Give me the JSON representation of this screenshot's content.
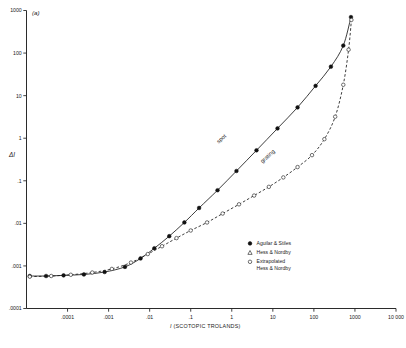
{
  "figure": {
    "panel_label": "(a)",
    "ylabel": "ΔI"
  },
  "chart_data": {
    "type": "line",
    "title": "",
    "subtitle": "",
    "xlabel": "I (SCOTOPIC TROLANDS)",
    "ylabel": "ΔI",
    "xscale": "log",
    "yscale": "log",
    "xlim": [
      1e-05,
      10000
    ],
    "ylim": [
      0.0001,
      1000
    ],
    "grid": false,
    "legend_position": "inside-lower-right",
    "xticklabels": [
      ".0001",
      ".001",
      ".01",
      ".1",
      "1",
      "10",
      "100",
      "1000",
      "10 000"
    ],
    "xtickvalues": [
      0.0001,
      0.001,
      0.01,
      0.1,
      1,
      10,
      100,
      1000,
      10000
    ],
    "yticklabels": [
      "1000",
      "100",
      "10",
      "1",
      ".1",
      ".01",
      ".001",
      ".0001"
    ],
    "ytickvalues": [
      1000,
      100,
      10,
      1,
      0.1,
      0.01,
      0.001,
      0.0001
    ],
    "annotations": [
      {
        "text": "spot",
        "x": 0.6,
        "y": 0.9,
        "rotation": -42
      },
      {
        "text": "grating",
        "x": 8,
        "y": 0.35,
        "rotation": -42
      }
    ],
    "legend": [
      {
        "label": "Aguilar & Stiles",
        "marker": "filled-circle"
      },
      {
        "label": "Hess & Nordby",
        "marker": "triangle"
      },
      {
        "label": "Extrapolated Hess & Nordby",
        "marker": "open-circle"
      }
    ],
    "series": [
      {
        "name": "spot",
        "marker": "filled-circle",
        "linestyle": "solid",
        "legend_ref": "Aguilar & Stiles",
        "x": [
          1.2e-05,
          3e-05,
          8e-05,
          0.00025,
          0.0008,
          0.0025,
          0.006,
          0.013,
          0.03,
          0.07,
          0.16,
          0.45,
          1.3,
          4.0,
          13,
          40,
          110,
          260,
          520,
          800
        ],
        "y": [
          0.00058,
          0.00058,
          0.0006,
          0.00063,
          0.00072,
          0.00095,
          0.0015,
          0.0026,
          0.005,
          0.0105,
          0.023,
          0.06,
          0.17,
          0.52,
          1.7,
          5.3,
          17,
          48,
          150,
          700
        ]
      },
      {
        "name": "grating",
        "marker": "open-circle",
        "linestyle": "dashed",
        "legend_ref": "Extrapolated Hess & Nordby",
        "x": [
          1.2e-05,
          4e-05,
          0.00012,
          0.0004,
          0.0012,
          0.0035,
          0.009,
          0.02,
          0.045,
          0.1,
          0.25,
          0.6,
          1.5,
          3.5,
          8,
          18,
          40,
          90,
          180,
          330,
          520,
          700,
          820
        ],
        "y": [
          0.00056,
          0.00058,
          0.00062,
          0.0007,
          0.00085,
          0.0012,
          0.0019,
          0.0029,
          0.0045,
          0.0068,
          0.0105,
          0.017,
          0.028,
          0.045,
          0.072,
          0.12,
          0.21,
          0.4,
          0.95,
          3.2,
          18,
          120,
          600
        ]
      }
    ]
  }
}
